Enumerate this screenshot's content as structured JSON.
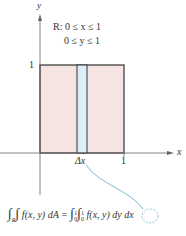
{
  "axes": {
    "x_label": "x",
    "y_label": "y",
    "x_tick": "1",
    "y_tick": "1"
  },
  "region": {
    "line1": "R: 0 ≤ x ≤ 1",
    "line2": "0 ≤ y ≤ 1"
  },
  "strip_label": "Δx",
  "formula": {
    "lhs": "∫_R∫ f(x, y) dA",
    "rhs": "∫_0^1∫_0^1 f(x, y) dy dx",
    "lhs_body": "f(x, y) dA =",
    "lhs_sub": "R",
    "rhs_body1": "f(x, y) dy",
    "rhs_dx": "dx",
    "lim_lower": "0",
    "lim_upper": "1"
  },
  "colors": {
    "region_fill": "#f6e4e2",
    "strip_fill": "#ddeef8",
    "callout": "#6ab4cc",
    "axis": "#555555"
  }
}
